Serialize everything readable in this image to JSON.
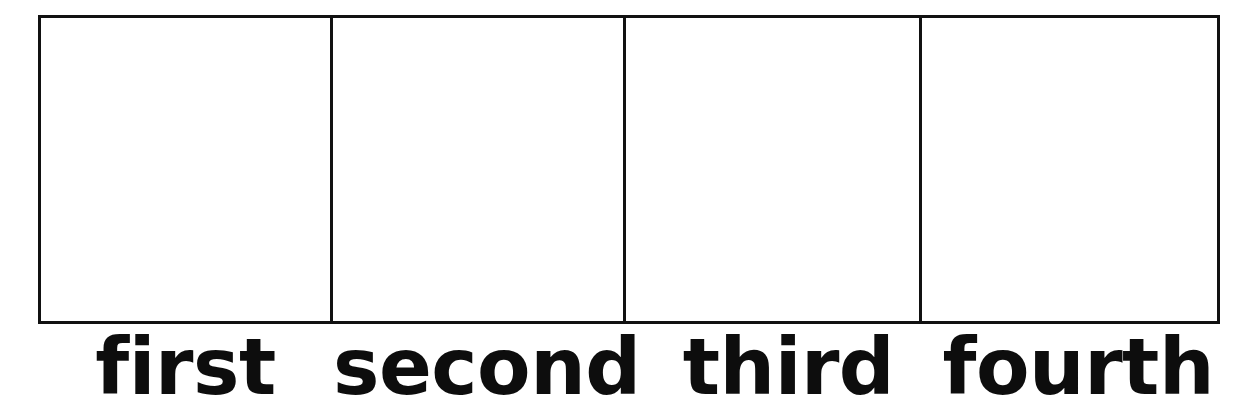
{
  "page": {
    "width": 1245,
    "height": 410,
    "background_color": "#ffffff",
    "ink_color": "#111111"
  },
  "worksheet": {
    "border_color": "#111111",
    "border_width_px": 3,
    "cell_fill_color": "#ffffff",
    "cells": [
      {
        "id": "cell-1",
        "content": ""
      },
      {
        "id": "cell-2",
        "content": ""
      },
      {
        "id": "cell-3",
        "content": ""
      },
      {
        "id": "cell-4",
        "content": ""
      }
    ],
    "labels": [
      {
        "id": "label-first",
        "text": "first"
      },
      {
        "id": "label-second",
        "text": "second"
      },
      {
        "id": "label-third",
        "text": "third"
      },
      {
        "id": "label-fourth",
        "text": "fourth"
      }
    ]
  }
}
